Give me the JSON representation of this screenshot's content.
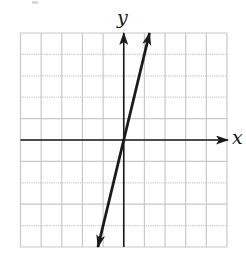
{
  "chart_data": {
    "type": "line",
    "title": "",
    "xlabel": "x",
    "ylabel": "y",
    "xlim": [
      -5,
      5
    ],
    "ylim": [
      -5,
      5
    ],
    "grid": true,
    "grid_step": 1,
    "axis_arrows": {
      "x": "positive",
      "y": "positive"
    },
    "tick_labels": false,
    "series": [
      {
        "name": "line",
        "equation": "y = 4x",
        "slope": 4,
        "intercept": 0,
        "x": [
          -1.25,
          0,
          1.25
        ],
        "y": [
          -5,
          0,
          5
        ],
        "arrows": "both"
      }
    ],
    "colors": {
      "grid": "#c8c8c8",
      "axes": "#1a1a1a",
      "line": "#1a1a1a",
      "background": "#ffffff"
    }
  },
  "labels": {
    "x_axis": "x",
    "y_axis": "y"
  }
}
